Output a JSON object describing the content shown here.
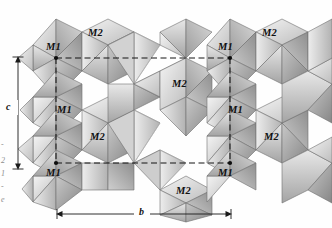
{
  "figure": {
    "type": "crystal-structure-polyhedral-diagram",
    "background_color": "#fefefe",
    "ink_color": "#111111"
  },
  "axes": [
    {
      "name": "c-axis",
      "label": "c",
      "orientation": "vertical",
      "x": 18,
      "y1": 57,
      "y2": 168,
      "label_x": 10,
      "label_y": 107
    },
    {
      "name": "b-axis",
      "label": "b",
      "orientation": "horizontal",
      "y": 214,
      "x1": 57,
      "x2": 231,
      "label_x": 140,
      "label_y": 206
    }
  ],
  "site_labels": [
    {
      "name": "M1",
      "text": "M1",
      "x": 46,
      "y": 41
    },
    {
      "name": "M2",
      "text": "M2",
      "x": 88,
      "y": 27
    },
    {
      "name": "M1",
      "text": "M1",
      "x": 57,
      "y": 104
    },
    {
      "name": "M2",
      "text": "M2",
      "x": 90,
      "y": 131
    },
    {
      "name": "M1",
      "text": "M1",
      "x": 46,
      "y": 167
    },
    {
      "name": "M1",
      "text": "M1",
      "x": 218,
      "y": 41
    },
    {
      "name": "M2",
      "text": "M2",
      "x": 262,
      "y": 27
    },
    {
      "name": "M2",
      "text": "M2",
      "x": 172,
      "y": 78
    },
    {
      "name": "M1",
      "text": "M1",
      "x": 228,
      "y": 104
    },
    {
      "name": "M2",
      "text": "M2",
      "x": 264,
      "y": 131
    },
    {
      "name": "M1",
      "text": "M1",
      "x": 218,
      "y": 167
    },
    {
      "name": "M2",
      "text": "M2",
      "x": 176,
      "y": 185
    }
  ],
  "unit_cell": {
    "name": "unit-cell-outline",
    "style": "dashed",
    "corner_dots": [
      {
        "x": 56,
        "y": 58
      },
      {
        "x": 230,
        "y": 58
      },
      {
        "x": 56,
        "y": 163
      },
      {
        "x": 230,
        "y": 163
      }
    ],
    "dashed_lines": [
      {
        "x1": 56,
        "y1": 58,
        "x2": 230,
        "y2": 58
      },
      {
        "x1": 56,
        "y1": 163,
        "x2": 230,
        "y2": 163
      },
      {
        "x1": 56,
        "y1": 58,
        "x2": 56,
        "y2": 163
      },
      {
        "x1": 230,
        "y1": 58,
        "x2": 230,
        "y2": 163
      }
    ]
  },
  "margin_fragments": [
    {
      "text": "2",
      "x": 1,
      "y": 160
    },
    {
      "text": "1",
      "x": 1,
      "y": 173
    },
    {
      "text": "-",
      "x": 1,
      "y": 186
    },
    {
      "text": "e",
      "x": 1,
      "y": 199
    },
    {
      "text": "-",
      "x": 1,
      "y": 144
    }
  ],
  "palette": {
    "face_lightest": "#f2f2f2",
    "face_light": "#dcdcdc",
    "face_mid": "#c0c0c0",
    "face_dark": "#9a9a9a",
    "face_darkest": "#777777",
    "outline": "#6f6f6f",
    "faint_line": "#bdbdbd"
  }
}
